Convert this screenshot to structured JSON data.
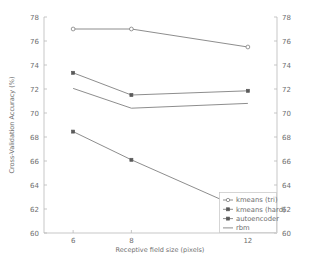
{
  "chart_data": {
    "type": "line",
    "title": "",
    "xlabel": "Receptive field size (pixels)",
    "ylabel": "Cross-Validation Accuracy (%)",
    "x": [
      6,
      8,
      12
    ],
    "xtick_labels": [
      "6",
      "8",
      "12"
    ],
    "xlim": [
      5.0,
      13.0
    ],
    "ylim": [
      60,
      78
    ],
    "ytick_labels": [
      "60",
      "62",
      "64",
      "66",
      "68",
      "70",
      "72",
      "74",
      "76",
      "78"
    ],
    "ytick_values": [
      60,
      62,
      64,
      66,
      68,
      70,
      72,
      74,
      76,
      78
    ],
    "y_axis_mirrored": true,
    "grid": false,
    "legend_position": "lower right",
    "series": [
      {
        "name": "kmeans (tri)",
        "values": [
          77.0,
          77.0,
          75.5
        ],
        "marker": "open-circle",
        "color": "#808080"
      },
      {
        "name": "kmeans (hard)",
        "values": [
          73.35,
          71.5,
          71.85
        ],
        "marker": "filled-plus",
        "color": "#808080"
      },
      {
        "name": "autoencoder",
        "values": [
          68.45,
          66.1,
          61.8
        ],
        "marker": "filled-square",
        "color": "#808080"
      },
      {
        "name": "rbm",
        "values": [
          72.05,
          70.4,
          70.8
        ],
        "marker": "none",
        "color": "#808080"
      }
    ]
  },
  "legend": {
    "entries": [
      "kmeans (tri)",
      "kmeans (hard)",
      "autoencoder",
      "rbm"
    ]
  },
  "axes": {
    "xlabel": "Receptive field size (pixels)",
    "ylabel": "Cross-Validation Accuracy (%)"
  }
}
